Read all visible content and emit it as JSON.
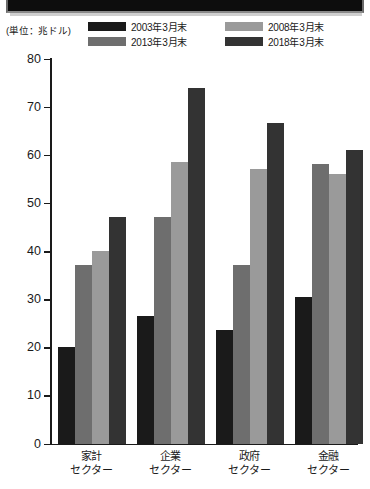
{
  "banner": {
    "name": "top-black-banner"
  },
  "unit_label": "(単位：兆ドル)",
  "legend": [
    {
      "label": "2003年3月末",
      "color": "#1a1a1a"
    },
    {
      "label": "2008年3月末",
      "color": "#9a9a9a"
    },
    {
      "label": "2013年3月末",
      "color": "#6e6e6e"
    },
    {
      "label": "2018年3月末",
      "color": "#333333"
    }
  ],
  "chart_data": {
    "type": "bar",
    "title": "",
    "xlabel": "",
    "ylabel": "(単位：兆ドル)",
    "ylim": [
      0,
      80
    ],
    "yticks": [
      0,
      10,
      20,
      30,
      40,
      50,
      60,
      70,
      80
    ],
    "ytick_labels": [
      "0",
      "10",
      "20",
      "30",
      "40",
      "50",
      "60",
      "70",
      "80"
    ],
    "grid": false,
    "legend_position": "top",
    "categories": [
      "家計セクター",
      "企業セクター",
      "政府セクター",
      "金融セクター"
    ],
    "category_lines": [
      [
        "家計",
        "セクター"
      ],
      [
        "企業",
        "セクター"
      ],
      [
        "政府",
        "セクター"
      ],
      [
        "金融",
        "セクター"
      ]
    ],
    "series": [
      {
        "name": "2003年3月末",
        "color": "#1a1a1a",
        "values": [
          20.0,
          26.5,
          23.5,
          30.5
        ]
      },
      {
        "name": "2008年3月末",
        "color": "#9a9a9a",
        "values": [
          40.0,
          58.5,
          57.0,
          56.0
        ]
      },
      {
        "name": "2013年3月末",
        "color": "#6e6e6e",
        "values": [
          37.0,
          47.0,
          37.0,
          58.0
        ]
      },
      {
        "name": "2018年3月末",
        "color": "#333333",
        "values": [
          47.0,
          73.8,
          66.5,
          61.0
        ]
      }
    ],
    "series_draw_order": [
      "2003年3月末",
      "2013年3月末",
      "2008年3月末",
      "2018年3月末"
    ]
  }
}
